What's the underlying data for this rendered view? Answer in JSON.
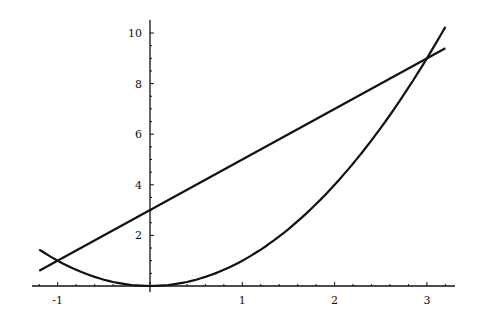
{
  "chart_data": {
    "type": "line",
    "title": "",
    "xlabel": "",
    "ylabel": "",
    "xlim": [
      -1.2,
      3.2
    ],
    "ylim": [
      0,
      10.3
    ],
    "grid": false,
    "legend": null,
    "x_ticks": [
      "-1",
      "1",
      "2",
      "3"
    ],
    "y_ticks": [
      "2",
      "4",
      "6",
      "8",
      "10"
    ],
    "series": [
      {
        "name": "y = x^2",
        "x": [
          -1.2,
          -1,
          0,
          1,
          2,
          3,
          3.2
        ],
        "values": [
          1.44,
          1,
          0,
          1,
          4,
          9,
          10.24
        ]
      },
      {
        "name": "y = 2x + 3",
        "x": [
          -1.2,
          3.2
        ],
        "values": [
          0.6,
          9.4
        ]
      }
    ],
    "annotations": [
      "intersections at (-1, 1) and (3, 9)"
    ]
  }
}
